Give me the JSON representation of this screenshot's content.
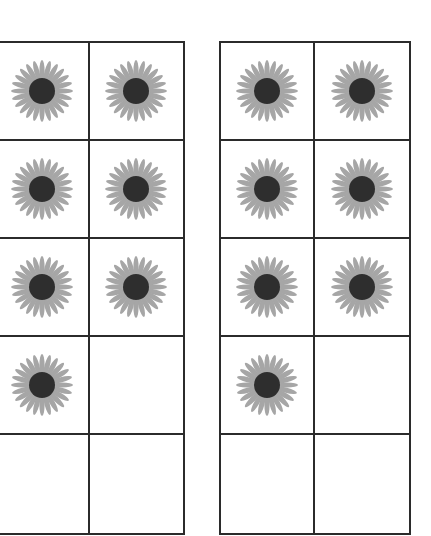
{
  "figure": {
    "type": "ten-frames",
    "colors": {
      "line": "#2b2b2b",
      "petal": "#a6a6a6",
      "center": "#2e2e2e",
      "background": "#ffffff"
    },
    "frames": [
      {
        "id": "left",
        "rows": 5,
        "cols": 2,
        "count": 7,
        "cells": [
          "flower",
          "flower",
          "flower",
          "flower",
          "flower",
          "flower",
          "flower",
          "empty",
          "empty",
          "empty"
        ]
      },
      {
        "id": "right",
        "rows": 5,
        "cols": 2,
        "count": 7,
        "cells": [
          "flower",
          "flower",
          "flower",
          "flower",
          "flower",
          "flower",
          "flower",
          "empty",
          "empty",
          "empty"
        ]
      }
    ]
  }
}
